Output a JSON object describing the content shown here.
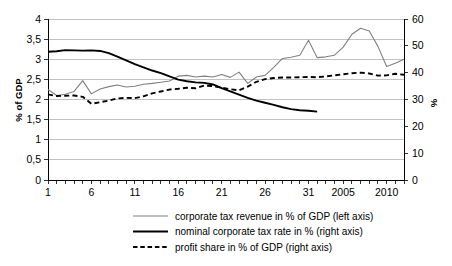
{
  "chart_data": {
    "type": "line",
    "title": "",
    "xlabel": "",
    "ylabel": "% of GDP",
    "y2label": "%",
    "ylim": [
      0,
      4
    ],
    "y2lim": [
      0,
      60
    ],
    "grid": true,
    "legend_position": "bottom",
    "x_tick_labels": [
      "1",
      "6",
      "11",
      "16",
      "21",
      "26",
      "31",
      "2005",
      "2010"
    ],
    "x_tick_indices": [
      0,
      5,
      10,
      15,
      20,
      25,
      30,
      34,
      39
    ],
    "x_count": 42,
    "y_tick_labels": [
      "0",
      "0,5",
      "1",
      "1,5",
      "2",
      "2,5",
      "3",
      "3,5",
      "4"
    ],
    "y_tick_values": [
      0,
      0.5,
      1,
      1.5,
      2,
      2.5,
      3,
      3.5,
      4
    ],
    "y2_tick_labels": [
      "0",
      "10",
      "20",
      "30",
      "40",
      "50",
      "60"
    ],
    "y2_tick_values": [
      0,
      10,
      20,
      30,
      40,
      50,
      60
    ],
    "series": [
      {
        "name": "corporate tax revenue in % of GDP (left axis)",
        "axis": "left",
        "style": "solid-thin",
        "color": "#808080",
        "values": [
          2.25,
          2.1,
          2.13,
          2.2,
          2.47,
          2.14,
          2.26,
          2.32,
          2.36,
          2.31,
          2.33,
          2.38,
          2.4,
          2.43,
          2.46,
          2.58,
          2.6,
          2.56,
          2.58,
          2.56,
          2.62,
          2.55,
          2.68,
          2.4,
          2.56,
          2.6,
          2.8,
          3.02,
          3.05,
          3.1,
          3.47,
          3.04,
          3.06,
          3.1,
          3.3,
          3.62,
          3.77,
          3.7,
          3.32,
          2.82,
          2.9,
          3.0
        ]
      },
      {
        "name": "nominal corporate tax rate in % (right axis)",
        "axis": "right",
        "style": "solid-thick",
        "color": "#000000",
        "values": [
          47.8,
          48.0,
          48.4,
          48.3,
          48.2,
          48.3,
          48.1,
          47.3,
          46.0,
          44.6,
          43.2,
          42.0,
          40.8,
          39.8,
          38.6,
          37.4,
          36.8,
          36.4,
          36.2,
          35.6,
          34.2,
          33.0,
          31.8,
          30.6,
          29.6,
          28.8,
          28.0,
          27.1,
          26.4,
          26.0,
          25.8,
          25.5,
          null,
          null,
          null,
          null,
          null,
          null,
          null,
          null,
          null,
          null
        ]
      },
      {
        "name": "profit share in % of GDP (right axis)",
        "axis": "right",
        "style": "dashed-thick",
        "color": "#000000",
        "values": [
          31.9,
          31.3,
          31.4,
          31.5,
          31.0,
          28.4,
          29.0,
          29.6,
          30.4,
          30.6,
          30.5,
          31.2,
          32.3,
          33.0,
          33.7,
          34.0,
          34.4,
          34.2,
          35.2,
          35.0,
          34.4,
          33.8,
          33.4,
          34.8,
          36.6,
          37.6,
          38.0,
          38.2,
          38.2,
          38.3,
          38.4,
          38.3,
          38.6,
          39.0,
          39.4,
          39.8,
          40.0,
          39.7,
          38.9,
          39.0,
          39.6,
          39.2
        ]
      }
    ]
  },
  "legend": {
    "items": [
      {
        "label": "corporate tax revenue in % of GDP (left axis)"
      },
      {
        "label": "nominal corporate tax rate in % (right axis)"
      },
      {
        "label": "profit share in % of GDP (right axis)"
      }
    ]
  },
  "axes": {
    "left_title": "% of GDP",
    "right_title": "%"
  }
}
